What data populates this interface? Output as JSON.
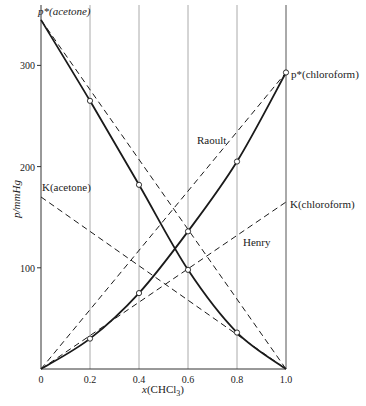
{
  "chart_data": {
    "type": "line",
    "title": "",
    "xlabel": "x(CHCl3)",
    "xlabel_parts": {
      "pre": "x",
      "main": "(CHCl",
      "sub": "3",
      "post": ")"
    },
    "ylabel": "p/mmHg",
    "xlim": [
      0,
      1.0
    ],
    "ylim": [
      0,
      350
    ],
    "x_ticks": [
      0,
      0.2,
      0.4,
      0.6,
      0.8,
      1.0
    ],
    "x_tick_labels": [
      "0",
      "0.2",
      "0.4",
      "0.6",
      "0.8",
      "1.0"
    ],
    "y_ticks": [
      100,
      200,
      300
    ],
    "y_tick_labels": [
      "100",
      "200",
      "300"
    ],
    "grid": {
      "vertical": true,
      "horizontal": false
    },
    "x": [
      0,
      0.2,
      0.4,
      0.6,
      0.8,
      1.0
    ],
    "series": [
      {
        "name": "p(acetone)",
        "style": "solid",
        "markers": "open-circle",
        "values": [
          345,
          265,
          182,
          98,
          36,
          0
        ]
      },
      {
        "name": "p(chloroform)",
        "style": "solid",
        "markers": "open-circle",
        "values": [
          0,
          30,
          75,
          136,
          205,
          293
        ]
      },
      {
        "name": "Raoult (acetone)",
        "style": "dashed",
        "x": [
          0,
          1.0
        ],
        "values": [
          345,
          0
        ]
      },
      {
        "name": "Raoult (chloroform)",
        "style": "dashed",
        "x": [
          0,
          1.0
        ],
        "values": [
          0,
          293
        ]
      },
      {
        "name": "Henry (acetone)",
        "style": "dashed",
        "x": [
          0,
          1.0
        ],
        "values": [
          170,
          0
        ]
      },
      {
        "name": "Henry (chloroform)",
        "style": "dashed",
        "x": [
          0,
          1.0
        ],
        "values": [
          0,
          165
        ]
      }
    ],
    "annotations": [
      {
        "id": "pstar_acetone",
        "text": "p*(acetone)",
        "x": 0,
        "y": 345
      },
      {
        "id": "pstar_chloroform",
        "text": "p*(chloroform)",
        "x": 1.0,
        "y": 293
      },
      {
        "id": "k_acetone",
        "text": "K(acetone)",
        "x": 0,
        "y": 170
      },
      {
        "id": "k_chloroform",
        "text": "K(chloroform)",
        "x": 1.0,
        "y": 165
      },
      {
        "id": "raoult",
        "text": "Raoult",
        "x": 0.76,
        "y": 215
      },
      {
        "id": "henry",
        "text": "Henry",
        "x": 0.78,
        "y": 110
      }
    ]
  },
  "labels": {
    "pstar_acetone": "p*(acetone)",
    "pstar_chloroform": "p*(chloroform)",
    "k_acetone": "K(acetone)",
    "k_chloroform": "K(chloroform)",
    "raoult": "Raoult",
    "henry": "Henry",
    "ylabel": "p/mmHg"
  }
}
